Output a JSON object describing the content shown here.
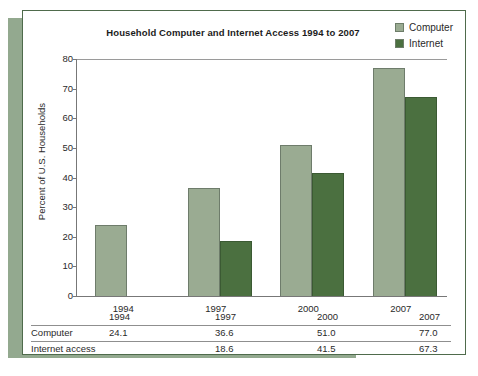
{
  "chart_data": {
    "type": "bar",
    "title": "Household Computer and Internet Access 1994 to 2007",
    "xlabel": "",
    "ylabel": "Percent of U.S. Households",
    "ylim": [
      0,
      80
    ],
    "ytick_step": 10,
    "yticks": [
      "80",
      "70",
      "60",
      "50",
      "40",
      "30",
      "20",
      "10",
      "0"
    ],
    "grid": false,
    "legend_position": "top-right",
    "categories": [
      "1994",
      "1997",
      "2000",
      "2007"
    ],
    "series": [
      {
        "name": "Computer",
        "color": "#9aab92",
        "values": [
          24.1,
          36.6,
          51.0,
          77.0
        ]
      },
      {
        "name": "Internet",
        "color": "#4b7040",
        "values": [
          null,
          18.6,
          41.5,
          67.3
        ]
      }
    ]
  },
  "legend": {
    "items": [
      {
        "label": "Computer",
        "swatch": "#9aab92"
      },
      {
        "label": "Internet",
        "swatch": "#4b7040"
      }
    ]
  },
  "table": {
    "header_row": {
      "label": "",
      "cells": [
        "1994",
        "1997",
        "2000",
        "2007"
      ]
    },
    "rows": [
      {
        "label": "Computer",
        "cells": [
          "24.1",
          "36.6",
          "51.0",
          "77.0"
        ]
      },
      {
        "label": "Internet access",
        "cells": [
          "",
          "18.6",
          "41.5",
          "67.3"
        ]
      }
    ]
  }
}
